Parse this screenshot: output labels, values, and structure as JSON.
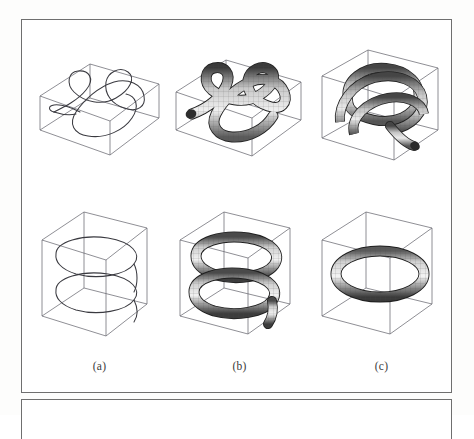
{
  "figure": {
    "kind": "scanned-paper-figure",
    "frame_color": "#6f6f6f",
    "background_color": "#ffffff",
    "columns": 3,
    "rows": 2,
    "captions": [
      {
        "id": "a",
        "label": "(a)"
      },
      {
        "id": "b",
        "label": "(b)"
      },
      {
        "id": "c",
        "label": "(c)"
      }
    ],
    "panels": {
      "top": [
        {
          "id": "top-a",
          "column": "a",
          "content": "wireframe-curve-in-flat-box",
          "description": "thin single-stroke space curve forming an open trefoil-like loop inside a wide flat wireframe box",
          "box_shape": "flat-wide",
          "render_style": "line-curve",
          "stroke_color": "#3a3a40"
        },
        {
          "id": "top-b",
          "column": "b",
          "content": "thick-tube-knot-in-flat-box",
          "description": "shaded meshed tube forming a trefoil knot with a free end, inside a wide flat wireframe box",
          "box_shape": "flat-wide",
          "render_style": "shaded-mesh-tube",
          "stroke_color": "#2a2a2a"
        },
        {
          "id": "top-c",
          "column": "c",
          "content": "tangled-tube-in-cube",
          "description": "multiple interlocked shaded tube loops forming a dense tangle inside a cubic wireframe box",
          "box_shape": "cube",
          "render_style": "shaded-mesh-tube",
          "stroke_color": "#2a2a2a"
        }
      ],
      "bottom": [
        {
          "id": "bottom-a",
          "column": "a",
          "content": "wireframe-helix-in-tall-box",
          "description": "thin single-stroke double-loop helix curve inside a tall wireframe box",
          "box_shape": "tall",
          "render_style": "line-curve",
          "stroke_color": "#3a3a40"
        },
        {
          "id": "bottom-b",
          "column": "b",
          "content": "thick-tube-helix-in-tall-box",
          "description": "shaded meshed tube following a two-turn helix with a trailing end, inside a tall wireframe box",
          "box_shape": "tall",
          "render_style": "shaded-mesh-tube",
          "stroke_color": "#2a2a2a"
        },
        {
          "id": "bottom-c",
          "column": "c",
          "content": "torus-ring-in-tall-box",
          "description": "shaded meshed closed circular torus ring lying flat inside a tall wireframe box",
          "box_shape": "tall",
          "render_style": "shaded-mesh-tube",
          "stroke_color": "#2a2a2a"
        }
      ]
    }
  }
}
